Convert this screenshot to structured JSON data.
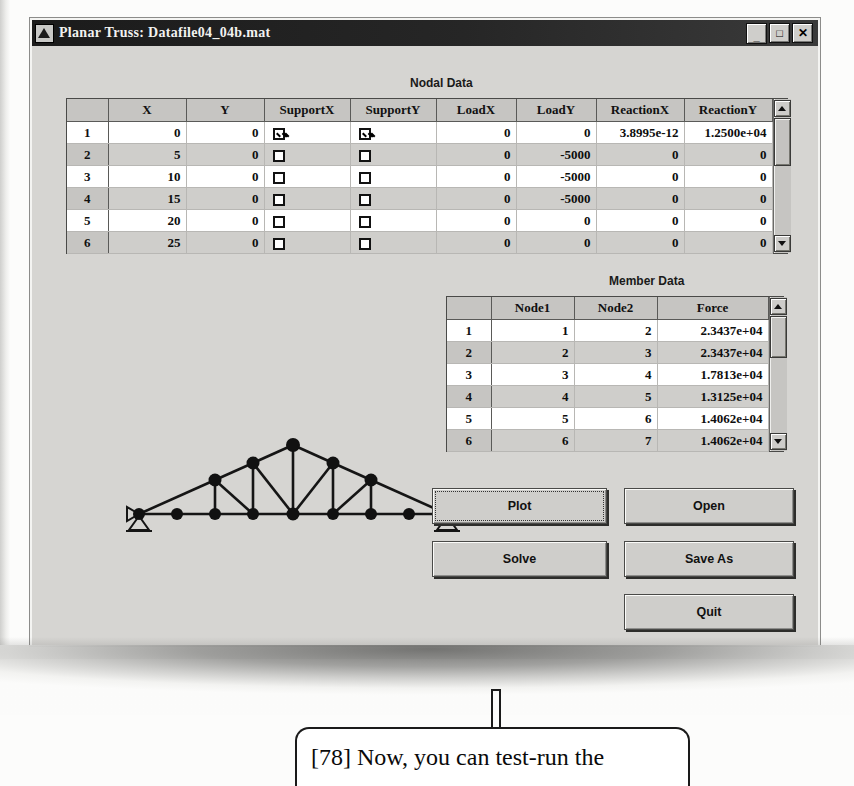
{
  "window": {
    "title": "Planar Truss: Datafile04_04b.mat",
    "icon": "truss-app-icon",
    "minimize_label": "_",
    "maximize_label": "□",
    "close_label": "✕"
  },
  "nodal_data": {
    "label": "Nodal Data",
    "columns": [
      "",
      "X",
      "Y",
      "SupportX",
      "SupportY",
      "LoadX",
      "LoadY",
      "ReactionX",
      "ReactionY"
    ],
    "rows": [
      {
        "n": "1",
        "X": "0",
        "Y": "0",
        "SupportX": true,
        "SupportY": true,
        "LoadX": "0",
        "LoadY": "0",
        "ReactionX": "3.8995e-12",
        "ReactionY": "1.2500e+04"
      },
      {
        "n": "2",
        "X": "5",
        "Y": "0",
        "SupportX": false,
        "SupportY": false,
        "LoadX": "0",
        "LoadY": "-5000",
        "ReactionX": "0",
        "ReactionY": "0"
      },
      {
        "n": "3",
        "X": "10",
        "Y": "0",
        "SupportX": false,
        "SupportY": false,
        "LoadX": "0",
        "LoadY": "-5000",
        "ReactionX": "0",
        "ReactionY": "0"
      },
      {
        "n": "4",
        "X": "15",
        "Y": "0",
        "SupportX": false,
        "SupportY": false,
        "LoadX": "0",
        "LoadY": "-5000",
        "ReactionX": "0",
        "ReactionY": "0"
      },
      {
        "n": "5",
        "X": "20",
        "Y": "0",
        "SupportX": false,
        "SupportY": false,
        "LoadX": "0",
        "LoadY": "0",
        "ReactionX": "0",
        "ReactionY": "0"
      },
      {
        "n": "6",
        "X": "25",
        "Y": "0",
        "SupportX": false,
        "SupportY": false,
        "LoadX": "0",
        "LoadY": "0",
        "ReactionX": "0",
        "ReactionY": "0"
      }
    ]
  },
  "member_data": {
    "label": "Member Data",
    "columns": [
      "",
      "Node1",
      "Node2",
      "Force"
    ],
    "rows": [
      {
        "n": "1",
        "Node1": "1",
        "Node2": "2",
        "Force": "2.3437e+04"
      },
      {
        "n": "2",
        "Node1": "2",
        "Node2": "3",
        "Force": "2.3437e+04"
      },
      {
        "n": "3",
        "Node1": "3",
        "Node2": "4",
        "Force": "1.7813e+04"
      },
      {
        "n": "4",
        "Node1": "4",
        "Node2": "5",
        "Force": "1.3125e+04"
      },
      {
        "n": "5",
        "Node1": "5",
        "Node2": "6",
        "Force": "1.4062e+04"
      },
      {
        "n": "6",
        "Node1": "6",
        "Node2": "7",
        "Force": "1.4062e+04"
      }
    ]
  },
  "buttons": {
    "plot": "Plot",
    "solve": "Solve",
    "open": "Open",
    "save_as": "Save As",
    "quit": "Quit"
  },
  "annotation": {
    "text": "[78] Now, you can test-run the"
  },
  "truss": {
    "bottom_nodes_x": [
      20,
      60,
      100,
      140,
      180,
      220,
      260,
      300,
      330
    ],
    "support_nodes": [
      1,
      9
    ]
  }
}
